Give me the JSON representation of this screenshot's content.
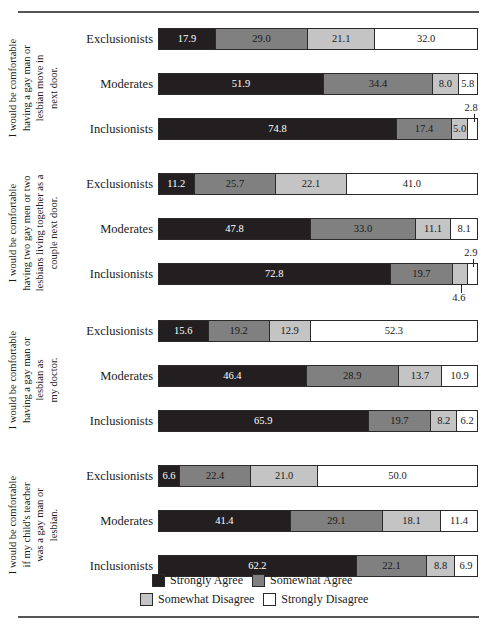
{
  "chart_data": {
    "type": "bar",
    "subtype": "stacked-horizontal-100pct",
    "title": "",
    "xlabel": "",
    "ylabel": "",
    "xlim": [
      0,
      100
    ],
    "grid": false,
    "legend_position": "bottom",
    "categories": [
      "Exclusionists",
      "Moderates",
      "Inclusionists"
    ],
    "legend": [
      "Strongly Agree",
      "Somewhat Agree",
      "Somewhat Disagree",
      "Strongly Disagree"
    ],
    "series_colors": {
      "strongly_agree": "#231f20",
      "somewhat_agree": "#808080",
      "somewhat_disagree": "#c4c4c4",
      "strongly_disagree": "#ffffff"
    },
    "groups": [
      {
        "question": "I would be comfortable\nhaving a gay man or\nlesbian move in\nnext door.",
        "rows": [
          {
            "category": "Exclusionists",
            "values": [
              17.9,
              29.0,
              21.1,
              32.0
            ],
            "labels": [
              "17.9",
              "29.0",
              "21.1",
              "32.0"
            ],
            "callouts": []
          },
          {
            "category": "Moderates",
            "values": [
              51.9,
              34.4,
              8.0,
              5.8
            ],
            "labels": [
              "51.9",
              "34.4",
              "8.0",
              "5.8"
            ],
            "callouts": []
          },
          {
            "category": "Inclusionists",
            "values": [
              74.8,
              17.4,
              5.0,
              2.8
            ],
            "labels": [
              "74.8",
              "17.4",
              "5.0",
              "2.8"
            ],
            "callouts": [
              {
                "text": "2.8",
                "segment_index": 3,
                "position": "above"
              }
            ]
          }
        ]
      },
      {
        "question": "I would be comfortable\nhaving two gay men or two\nlesbians living together as a\ncouple next door.",
        "rows": [
          {
            "category": "Exclusionists",
            "values": [
              11.2,
              25.7,
              22.1,
              41.0
            ],
            "labels": [
              "11.2",
              "25.7",
              "22.1",
              "41.0"
            ],
            "callouts": []
          },
          {
            "category": "Moderates",
            "values": [
              47.8,
              33.0,
              11.1,
              8.1
            ],
            "labels": [
              "47.8",
              "33.0",
              "11.1",
              "8.1"
            ],
            "callouts": []
          },
          {
            "category": "Inclusionists",
            "values": [
              72.8,
              19.7,
              4.6,
              2.9
            ],
            "labels": [
              "72.8",
              "19.7",
              "4.6",
              "2.9"
            ],
            "callouts": [
              {
                "text": "2.9",
                "segment_index": 3,
                "position": "above"
              },
              {
                "text": "4.6",
                "segment_index": 2,
                "position": "below"
              }
            ]
          }
        ]
      },
      {
        "question": "I would be comfortable\nhaving a gay man or\nlesbian as\nmy doctor.",
        "rows": [
          {
            "category": "Exclusionists",
            "values": [
              15.6,
              19.2,
              12.9,
              52.3
            ],
            "labels": [
              "15.6",
              "19.2",
              "12.9",
              "52.3"
            ],
            "callouts": []
          },
          {
            "category": "Moderates",
            "values": [
              46.4,
              28.9,
              13.7,
              10.9
            ],
            "labels": [
              "46.4",
              "28.9",
              "13.7",
              "10.9"
            ],
            "callouts": []
          },
          {
            "category": "Inclusionists",
            "values": [
              65.9,
              19.7,
              8.2,
              6.2
            ],
            "labels": [
              "65.9",
              "19.7",
              "8.2",
              "6.2"
            ],
            "callouts": []
          }
        ]
      },
      {
        "question": "I would be comfortable\nif my child's teacher\nwas a gay man or\nlesbian.",
        "rows": [
          {
            "category": "Exclusionists",
            "values": [
              6.6,
              22.4,
              21.0,
              50.0
            ],
            "labels": [
              "6.6",
              "22.4",
              "21.0",
              "50.0"
            ],
            "callouts": []
          },
          {
            "category": "Moderates",
            "values": [
              41.4,
              29.1,
              18.1,
              11.4
            ],
            "labels": [
              "41.4",
              "29.1",
              "18.1",
              "11.4"
            ],
            "callouts": []
          },
          {
            "category": "Inclusionists",
            "values": [
              62.2,
              22.1,
              8.8,
              6.9
            ],
            "labels": [
              "62.2",
              "22.1",
              "8.8",
              "6.9"
            ],
            "callouts": []
          }
        ]
      }
    ]
  }
}
